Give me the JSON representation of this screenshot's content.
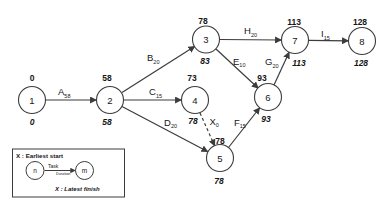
{
  "diagram": {
    "type": "activity-network",
    "nodes": [
      {
        "id": "1",
        "early": "0",
        "late": "0"
      },
      {
        "id": "2",
        "early": "58",
        "late": "58"
      },
      {
        "id": "3",
        "early": "78",
        "late": "83"
      },
      {
        "id": "4",
        "early": "73",
        "late": "78"
      },
      {
        "id": "5",
        "early": "78",
        "late": "78"
      },
      {
        "id": "6",
        "early": "93",
        "late": "93"
      },
      {
        "id": "7",
        "early": "113",
        "late": "113"
      },
      {
        "id": "8",
        "early": "128",
        "late": "128"
      }
    ],
    "edges": [
      {
        "name": "A",
        "duration": "58",
        "from": "1",
        "to": "2",
        "style": "solid"
      },
      {
        "name": "B",
        "duration": "20",
        "from": "2",
        "to": "3",
        "style": "solid"
      },
      {
        "name": "C",
        "duration": "15",
        "from": "2",
        "to": "4",
        "style": "solid"
      },
      {
        "name": "D",
        "duration": "20",
        "from": "2",
        "to": "5",
        "style": "solid"
      },
      {
        "name": "E",
        "duration": "10",
        "from": "3",
        "to": "6",
        "style": "solid"
      },
      {
        "name": "F",
        "duration": "15",
        "from": "5",
        "to": "6",
        "style": "solid"
      },
      {
        "name": "G",
        "duration": "20",
        "from": "6",
        "to": "7",
        "style": "solid"
      },
      {
        "name": "H",
        "duration": "20",
        "from": "3",
        "to": "7",
        "style": "solid"
      },
      {
        "name": "I",
        "duration": "15",
        "from": "7",
        "to": "8",
        "style": "solid"
      },
      {
        "name": "X",
        "duration": "0",
        "from": "4",
        "to": "5",
        "style": "dashed"
      }
    ],
    "legend": {
      "title": "X : Earliest start",
      "start_node": "n",
      "end_node": "m",
      "task_label": "Task",
      "duration_label": "Duration",
      "footer": "X : Latest finish"
    },
    "colors": {
      "line": "#3c3c3c",
      "text": "#161616",
      "background": "#ffffff"
    }
  }
}
